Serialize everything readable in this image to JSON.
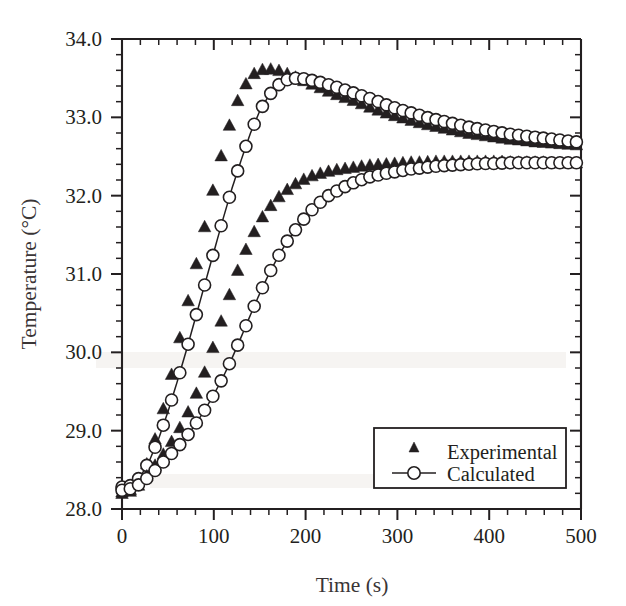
{
  "figure": {
    "background_color": "#ffffff",
    "ink_color": "#231f20",
    "plot_left_px": 122,
    "plot_right_px": 581,
    "plot_top_px": 39,
    "plot_bottom_px": 509
  },
  "axes": {
    "x": {
      "label": "Time (s)",
      "min": 0,
      "max": 500,
      "major_ticks": [
        0,
        100,
        200,
        300,
        400,
        500
      ],
      "tick_labels": [
        "0",
        "100",
        "200",
        "300",
        "400",
        "500"
      ],
      "minor_tick_step": 20
    },
    "y": {
      "label": "Temperature (°C)",
      "min": 28.0,
      "max": 34.0,
      "major_ticks": [
        28.0,
        29.0,
        30.0,
        31.0,
        32.0,
        33.0,
        34.0
      ],
      "tick_labels": [
        "28.0",
        "29.0",
        "30.0",
        "31.0",
        "32.0",
        "33.0",
        "34.0"
      ],
      "minor_tick_step": 0.2
    }
  },
  "legend": {
    "position": "lower-right",
    "entries": [
      {
        "label": "Experimental",
        "marker": "filled-triangle",
        "has_line": false
      },
      {
        "label": "Calculated",
        "marker": "open-circle",
        "has_line": true
      }
    ]
  },
  "chart_data": {
    "type": "line",
    "title": "",
    "xlabel": "Time (s)",
    "ylabel": "Temperature (°C)",
    "xlim": [
      0,
      500
    ],
    "ylim": [
      28.0,
      34.0
    ],
    "grid": false,
    "legend_position": "lower-right",
    "series": [
      {
        "name": "Experimental (upper)",
        "marker": "filled-triangle",
        "line": false,
        "x": [
          0,
          8,
          16,
          24,
          32,
          40,
          48,
          56,
          64,
          72,
          80,
          88,
          96,
          104,
          112,
          120,
          128,
          136,
          144,
          152,
          160,
          168,
          176,
          184,
          196,
          208,
          220,
          232,
          244,
          256,
          268,
          280,
          292,
          304,
          316,
          328,
          340,
          352,
          364,
          376,
          388,
          400,
          412,
          424,
          436,
          448,
          460,
          472,
          484,
          496
        ],
        "y": [
          28.22,
          28.24,
          28.32,
          28.48,
          28.74,
          29.05,
          29.42,
          29.82,
          30.24,
          30.66,
          31.08,
          31.5,
          31.92,
          32.32,
          32.7,
          33.02,
          33.28,
          33.45,
          33.56,
          33.61,
          33.62,
          33.61,
          33.58,
          33.54,
          33.48,
          33.42,
          33.36,
          33.3,
          33.25,
          33.2,
          33.14,
          33.09,
          33.04,
          33.0,
          32.96,
          32.92,
          32.89,
          32.86,
          32.83,
          32.8,
          32.78,
          32.76,
          32.74,
          32.72,
          32.71,
          32.69,
          32.68,
          32.67,
          32.66,
          32.65
        ]
      },
      {
        "name": "Calculated (upper)",
        "marker": "open-circle",
        "line": true,
        "x": [
          0,
          10,
          20,
          30,
          40,
          50,
          60,
          70,
          80,
          90,
          100,
          110,
          120,
          130,
          140,
          150,
          160,
          170,
          180,
          190,
          200,
          215,
          230,
          245,
          260,
          275,
          290,
          305,
          320,
          335,
          350,
          365,
          380,
          395,
          410,
          425,
          440,
          455,
          470,
          485,
          500
        ],
        "y": [
          28.28,
          28.3,
          28.41,
          28.62,
          28.9,
          29.24,
          29.62,
          30.02,
          30.44,
          30.86,
          31.28,
          31.7,
          32.1,
          32.46,
          32.8,
          33.08,
          33.28,
          33.41,
          33.48,
          33.5,
          33.49,
          33.45,
          33.4,
          33.34,
          33.28,
          33.22,
          33.15,
          33.09,
          33.04,
          32.99,
          32.95,
          32.91,
          32.87,
          32.84,
          32.81,
          32.78,
          32.76,
          32.74,
          32.72,
          32.7,
          32.68
        ]
      },
      {
        "name": "Experimental (lower)",
        "marker": "filled-triangle",
        "line": false,
        "x": [
          0,
          8,
          16,
          24,
          32,
          40,
          48,
          56,
          64,
          72,
          80,
          88,
          96,
          104,
          112,
          120,
          130,
          140,
          150,
          160,
          172,
          184,
          196,
          208,
          220,
          232,
          244,
          256,
          268,
          280,
          292,
          304,
          316,
          328,
          340,
          352,
          364,
          376,
          388,
          400,
          412,
          424,
          436,
          448,
          460,
          472,
          484,
          496
        ],
        "y": [
          28.2,
          28.22,
          28.28,
          28.38,
          28.5,
          28.62,
          28.75,
          28.9,
          29.06,
          29.24,
          29.45,
          29.68,
          29.95,
          30.25,
          30.55,
          30.85,
          31.18,
          31.45,
          31.68,
          31.85,
          32.0,
          32.12,
          32.2,
          32.26,
          32.3,
          32.33,
          32.35,
          32.37,
          32.39,
          32.4,
          32.41,
          32.42,
          32.43,
          32.43,
          32.44,
          32.44,
          32.44,
          32.44,
          32.44,
          32.44,
          32.44,
          32.43,
          32.43,
          32.43,
          32.43,
          32.42,
          32.42,
          32.42
        ]
      },
      {
        "name": "Calculated (lower)",
        "marker": "open-circle",
        "line": true,
        "x": [
          0,
          10,
          20,
          30,
          40,
          50,
          60,
          70,
          80,
          90,
          100,
          110,
          120,
          130,
          140,
          150,
          160,
          170,
          180,
          195,
          210,
          225,
          240,
          255,
          270,
          285,
          300,
          315,
          330,
          345,
          360,
          375,
          390,
          405,
          420,
          435,
          450,
          465,
          480,
          495,
          500
        ],
        "y": [
          28.24,
          28.26,
          28.32,
          28.42,
          28.54,
          28.66,
          28.78,
          28.92,
          29.08,
          29.26,
          29.46,
          29.68,
          29.93,
          30.2,
          30.48,
          30.75,
          31.0,
          31.22,
          31.42,
          31.66,
          31.86,
          32.0,
          32.1,
          32.18,
          32.24,
          32.28,
          32.31,
          32.34,
          32.36,
          32.38,
          32.39,
          32.4,
          32.41,
          32.41,
          32.42,
          32.42,
          32.42,
          32.42,
          32.42,
          32.42,
          32.42
        ]
      }
    ]
  }
}
